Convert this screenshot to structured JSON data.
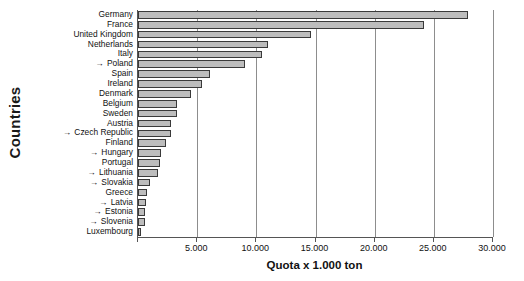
{
  "chart_data": {
    "type": "bar",
    "orientation": "horizontal",
    "title": "",
    "xlabel": "Quota x 1.000 ton",
    "ylabel": "Countries",
    "xlim": [
      0,
      30000
    ],
    "xticks": [
      0,
      5000,
      10000,
      15000,
      20000,
      25000,
      30000
    ],
    "xtick_labels": [
      "",
      "5.000",
      "10.000",
      "15.000",
      "20.000",
      "25.000",
      "30.000"
    ],
    "grid": "vertical",
    "legend": "none",
    "bar_fill_color": "#bdbdbd",
    "bar_border_color": "#3a3a3a",
    "axis_color": "#555555",
    "marker_symbol": "→",
    "marker_meaning": "arrow prefix marks new member states",
    "categories": [
      "Germany",
      "France",
      "United Kingdom",
      "Netherlands",
      "Italy",
      "Poland",
      "Spain",
      "Ireland",
      "Denmark",
      "Belgium",
      "Sweden",
      "Austria",
      "Czech Republic",
      "Finland",
      "Hungary",
      "Portugal",
      "Lithuania",
      "Slovakia",
      "Greece",
      "Latvia",
      "Estonia",
      "Slovenia",
      "Luxembourg"
    ],
    "marked": [
      false,
      false,
      false,
      false,
      false,
      true,
      false,
      false,
      false,
      false,
      false,
      false,
      true,
      false,
      true,
      false,
      true,
      true,
      false,
      true,
      true,
      true,
      false
    ],
    "values": [
      27900,
      24200,
      14600,
      11000,
      10500,
      9000,
      6100,
      5400,
      4500,
      3300,
      3300,
      2750,
      2750,
      2400,
      1950,
      1900,
      1650,
      1050,
      800,
      700,
      620,
      570,
      270
    ]
  }
}
